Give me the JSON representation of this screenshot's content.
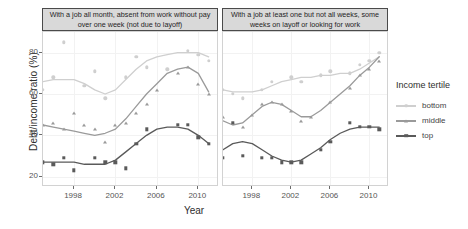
{
  "axes": {
    "ylabel": "Debt/income ratio (%)",
    "xlabel": "Year",
    "yticks": [
      "20",
      "40",
      "60",
      "80"
    ],
    "xticks": [
      "1998",
      "2002",
      "2006",
      "2010"
    ]
  },
  "panels": [
    {
      "id": "A",
      "title": "With a job all month, absent from work without pay over one week (not due to layoff)"
    },
    {
      "id": "B",
      "title": "With a job at least one but not all weeks, some weeks on layoff or looking for work"
    }
  ],
  "legend": {
    "title": "Income tertile",
    "items": [
      {
        "label": "bottom",
        "color": "#cfcfcf",
        "marker": "circle"
      },
      {
        "label": "middle",
        "color": "#9a9a9a",
        "marker": "triangle"
      },
      {
        "label": "top",
        "color": "#5a5a5a",
        "marker": "square"
      }
    ]
  },
  "chart_data": {
    "type": "scatter",
    "title": "",
    "xlabel": "Year",
    "ylabel": "Debt/income ratio (%)",
    "xlim": [
      1995,
      2012
    ],
    "ylim": [
      15,
      90
    ],
    "xticks": [
      1998,
      2002,
      2006,
      2010
    ],
    "yticks": [
      20,
      40,
      60,
      80
    ],
    "grid": true,
    "legend_title": "Income tertile",
    "legend_position": "right",
    "facets": [
      {
        "name": "With a job all month, absent from work without pay over one week (not due to layoff)",
        "series": [
          {
            "name": "bottom",
            "color": "#cfcfcf",
            "marker": "circle",
            "points": [
              {
                "x": 1995,
                "y": 62
              },
              {
                "x": 1996,
                "y": 68
              },
              {
                "x": 1997,
                "y": 85
              },
              {
                "x": 1999,
                "y": 64
              },
              {
                "x": 2000,
                "y": 71
              },
              {
                "x": 2001,
                "y": 58
              },
              {
                "x": 2003,
                "y": 68
              },
              {
                "x": 2004,
                "y": 78
              },
              {
                "x": 2005,
                "y": 73
              },
              {
                "x": 2007,
                "y": 72
              },
              {
                "x": 2009,
                "y": 81
              },
              {
                "x": 2010,
                "y": 79
              },
              {
                "x": 2011,
                "y": 76
              }
            ],
            "smooth": [
              {
                "x": 1995,
                "y": 66
              },
              {
                "x": 1996,
                "y": 67
              },
              {
                "x": 1997,
                "y": 67
              },
              {
                "x": 1998,
                "y": 67
              },
              {
                "x": 1999,
                "y": 65
              },
              {
                "x": 2000,
                "y": 62
              },
              {
                "x": 2001,
                "y": 60
              },
              {
                "x": 2002,
                "y": 62
              },
              {
                "x": 2003,
                "y": 67
              },
              {
                "x": 2004,
                "y": 72
              },
              {
                "x": 2005,
                "y": 76
              },
              {
                "x": 2006,
                "y": 78
              },
              {
                "x": 2007,
                "y": 79
              },
              {
                "x": 2008,
                "y": 80
              },
              {
                "x": 2009,
                "y": 80
              },
              {
                "x": 2010,
                "y": 80
              },
              {
                "x": 2011,
                "y": 78
              }
            ]
          },
          {
            "name": "middle",
            "color": "#9a9a9a",
            "marker": "triangle",
            "points": [
              {
                "x": 1995,
                "y": 45
              },
              {
                "x": 1996,
                "y": 46
              },
              {
                "x": 1997,
                "y": 43
              },
              {
                "x": 1998,
                "y": 51
              },
              {
                "x": 1999,
                "y": 45
              },
              {
                "x": 2000,
                "y": 43
              },
              {
                "x": 2001,
                "y": 37
              },
              {
                "x": 2002,
                "y": 45
              },
              {
                "x": 2003,
                "y": 46
              },
              {
                "x": 2004,
                "y": 51
              },
              {
                "x": 2005,
                "y": 55
              },
              {
                "x": 2006,
                "y": 62
              },
              {
                "x": 2008,
                "y": 70
              },
              {
                "x": 2009,
                "y": 73
              },
              {
                "x": 2010,
                "y": 65
              },
              {
                "x": 2011,
                "y": 60
              }
            ],
            "smooth": [
              {
                "x": 1995,
                "y": 45
              },
              {
                "x": 1996,
                "y": 44
              },
              {
                "x": 1997,
                "y": 43
              },
              {
                "x": 1998,
                "y": 42
              },
              {
                "x": 1999,
                "y": 41
              },
              {
                "x": 2000,
                "y": 40
              },
              {
                "x": 2001,
                "y": 41
              },
              {
                "x": 2002,
                "y": 43
              },
              {
                "x": 2003,
                "y": 48
              },
              {
                "x": 2004,
                "y": 54
              },
              {
                "x": 2005,
                "y": 60
              },
              {
                "x": 2006,
                "y": 65
              },
              {
                "x": 2007,
                "y": 70
              },
              {
                "x": 2008,
                "y": 72
              },
              {
                "x": 2009,
                "y": 73
              },
              {
                "x": 2010,
                "y": 70
              },
              {
                "x": 2011,
                "y": 61
              }
            ]
          },
          {
            "name": "top",
            "color": "#5a5a5a",
            "marker": "square",
            "points": [
              {
                "x": 1995,
                "y": 27
              },
              {
                "x": 1996,
                "y": 26
              },
              {
                "x": 1997,
                "y": 29
              },
              {
                "x": 1998,
                "y": 23
              },
              {
                "x": 2000,
                "y": 29
              },
              {
                "x": 2001,
                "y": 27
              },
              {
                "x": 2002,
                "y": 27
              },
              {
                "x": 2003,
                "y": 24
              },
              {
                "x": 2004,
                "y": 36
              },
              {
                "x": 2005,
                "y": 43
              },
              {
                "x": 2008,
                "y": 45
              },
              {
                "x": 2009,
                "y": 45
              },
              {
                "x": 2010,
                "y": 39
              },
              {
                "x": 2011,
                "y": 36
              }
            ],
            "smooth": [
              {
                "x": 1995,
                "y": 27
              },
              {
                "x": 1996,
                "y": 27
              },
              {
                "x": 1997,
                "y": 27
              },
              {
                "x": 1998,
                "y": 27
              },
              {
                "x": 1999,
                "y": 26
              },
              {
                "x": 2000,
                "y": 26
              },
              {
                "x": 2001,
                "y": 26
              },
              {
                "x": 2002,
                "y": 28
              },
              {
                "x": 2003,
                "y": 32
              },
              {
                "x": 2004,
                "y": 36
              },
              {
                "x": 2005,
                "y": 40
              },
              {
                "x": 2006,
                "y": 43
              },
              {
                "x": 2007,
                "y": 44
              },
              {
                "x": 2008,
                "y": 44
              },
              {
                "x": 2009,
                "y": 43
              },
              {
                "x": 2010,
                "y": 40
              },
              {
                "x": 2011,
                "y": 36
              }
            ]
          }
        ]
      },
      {
        "name": "With a job at least one but not all weeks, some weeks on layoff or looking for work",
        "series": [
          {
            "name": "bottom",
            "color": "#cfcfcf",
            "marker": "circle",
            "points": [
              {
                "x": 1995,
                "y": 62
              },
              {
                "x": 1996,
                "y": 60
              },
              {
                "x": 1997,
                "y": 58
              },
              {
                "x": 1999,
                "y": 62
              },
              {
                "x": 2000,
                "y": 66
              },
              {
                "x": 2002,
                "y": 68
              },
              {
                "x": 2003,
                "y": 66
              },
              {
                "x": 2005,
                "y": 69
              },
              {
                "x": 2006,
                "y": 71
              },
              {
                "x": 2008,
                "y": 70
              },
              {
                "x": 2009,
                "y": 74
              },
              {
                "x": 2010,
                "y": 76
              },
              {
                "x": 2011,
                "y": 80
              }
            ],
            "smooth": [
              {
                "x": 1995,
                "y": 62
              },
              {
                "x": 1996,
                "y": 61
              },
              {
                "x": 1997,
                "y": 61
              },
              {
                "x": 1998,
                "y": 61
              },
              {
                "x": 1999,
                "y": 62
              },
              {
                "x": 2000,
                "y": 64
              },
              {
                "x": 2001,
                "y": 66
              },
              {
                "x": 2002,
                "y": 67
              },
              {
                "x": 2003,
                "y": 68
              },
              {
                "x": 2004,
                "y": 68
              },
              {
                "x": 2005,
                "y": 69
              },
              {
                "x": 2006,
                "y": 69
              },
              {
                "x": 2007,
                "y": 70
              },
              {
                "x": 2008,
                "y": 70
              },
              {
                "x": 2009,
                "y": 72
              },
              {
                "x": 2010,
                "y": 75
              },
              {
                "x": 2011,
                "y": 78
              }
            ]
          },
          {
            "name": "middle",
            "color": "#9a9a9a",
            "marker": "triangle",
            "points": [
              {
                "x": 1995,
                "y": 49
              },
              {
                "x": 1996,
                "y": 46
              },
              {
                "x": 1997,
                "y": 44
              },
              {
                "x": 1998,
                "y": 50
              },
              {
                "x": 1999,
                "y": 55
              },
              {
                "x": 2000,
                "y": 56
              },
              {
                "x": 2001,
                "y": 55
              },
              {
                "x": 2002,
                "y": 52
              },
              {
                "x": 2003,
                "y": 47
              },
              {
                "x": 2004,
                "y": 49
              },
              {
                "x": 2006,
                "y": 56
              },
              {
                "x": 2008,
                "y": 63
              },
              {
                "x": 2009,
                "y": 69
              },
              {
                "x": 2010,
                "y": 72
              },
              {
                "x": 2011,
                "y": 76
              }
            ],
            "smooth": [
              {
                "x": 1995,
                "y": 47
              },
              {
                "x": 1996,
                "y": 45
              },
              {
                "x": 1997,
                "y": 46
              },
              {
                "x": 1998,
                "y": 50
              },
              {
                "x": 1999,
                "y": 54
              },
              {
                "x": 2000,
                "y": 56
              },
              {
                "x": 2001,
                "y": 55
              },
              {
                "x": 2002,
                "y": 52
              },
              {
                "x": 2003,
                "y": 49
              },
              {
                "x": 2004,
                "y": 49
              },
              {
                "x": 2005,
                "y": 52
              },
              {
                "x": 2006,
                "y": 56
              },
              {
                "x": 2007,
                "y": 60
              },
              {
                "x": 2008,
                "y": 64
              },
              {
                "x": 2009,
                "y": 69
              },
              {
                "x": 2010,
                "y": 73
              },
              {
                "x": 2011,
                "y": 78
              }
            ]
          },
          {
            "name": "top",
            "color": "#5a5a5a",
            "marker": "square",
            "points": [
              {
                "x": 1995,
                "y": 29
              },
              {
                "x": 1996,
                "y": 46
              },
              {
                "x": 1997,
                "y": 30
              },
              {
                "x": 1999,
                "y": 29
              },
              {
                "x": 2000,
                "y": 29
              },
              {
                "x": 2001,
                "y": 27
              },
              {
                "x": 2002,
                "y": 27
              },
              {
                "x": 2003,
                "y": 27
              },
              {
                "x": 2005,
                "y": 33
              },
              {
                "x": 2006,
                "y": 37
              },
              {
                "x": 2008,
                "y": 46
              },
              {
                "x": 2009,
                "y": 44
              },
              {
                "x": 2010,
                "y": 44
              },
              {
                "x": 2011,
                "y": 43
              }
            ],
            "smooth": [
              {
                "x": 1995,
                "y": 33
              },
              {
                "x": 1996,
                "y": 36
              },
              {
                "x": 1997,
                "y": 37
              },
              {
                "x": 1998,
                "y": 36
              },
              {
                "x": 1999,
                "y": 33
              },
              {
                "x": 2000,
                "y": 30
              },
              {
                "x": 2001,
                "y": 28
              },
              {
                "x": 2002,
                "y": 27
              },
              {
                "x": 2003,
                "y": 28
              },
              {
                "x": 2004,
                "y": 31
              },
              {
                "x": 2005,
                "y": 34
              },
              {
                "x": 2006,
                "y": 38
              },
              {
                "x": 2007,
                "y": 41
              },
              {
                "x": 2008,
                "y": 43
              },
              {
                "x": 2009,
                "y": 44
              },
              {
                "x": 2010,
                "y": 44
              },
              {
                "x": 2011,
                "y": 44
              }
            ]
          }
        ]
      }
    ]
  }
}
